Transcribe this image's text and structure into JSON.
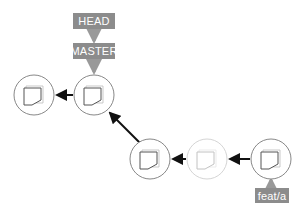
{
  "refs": {
    "head": "HEAD",
    "master": "MASTER",
    "feature": "feat/a"
  },
  "commits": [
    {
      "id": "c1",
      "state": "normal"
    },
    {
      "id": "c2",
      "state": "normal"
    },
    {
      "id": "c3",
      "state": "normal"
    },
    {
      "id": "c4",
      "state": "faded"
    },
    {
      "id": "c5",
      "state": "normal"
    }
  ],
  "colors": {
    "label_bg": "#8c8c8c",
    "arrow": "#111111",
    "circle": "#777777",
    "faded": "#cccccc"
  }
}
